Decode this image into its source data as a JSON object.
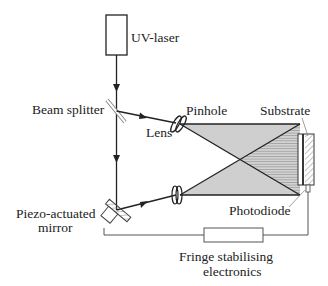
{
  "diagram": {
    "labels": {
      "uv_laser": "UV-laser",
      "beam_splitter": "Beam splitter",
      "lens": "Lens",
      "pinhole": "Pinhole",
      "substrate": "Substrate",
      "photodiode": "Photodiode",
      "piezo_line1": "Piezo-actuated",
      "piezo_line2": "mirror",
      "fringe_line1": "Fringe stabilising",
      "fringe_line2": "electronics"
    },
    "colors": {
      "line": "#222222",
      "beam_fill": "#cfcfcf",
      "wire": "#555555"
    }
  }
}
